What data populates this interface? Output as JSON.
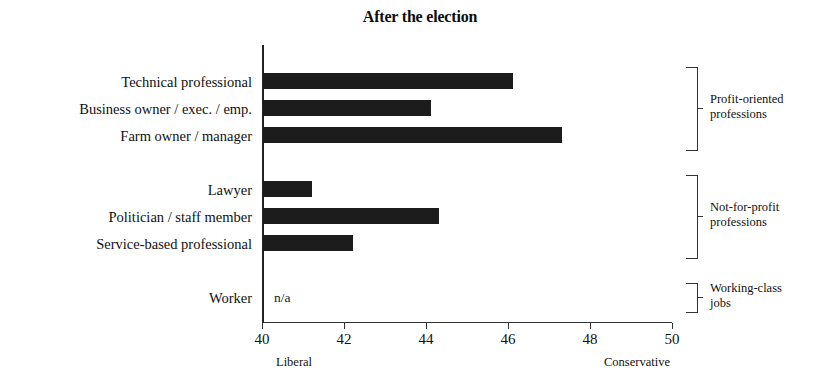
{
  "chart_data": {
    "type": "bar",
    "orientation": "horizontal",
    "title": "After the election",
    "xlabel": "",
    "ylabel": "",
    "xlim": [
      40,
      50
    ],
    "xticks": [
      40,
      42,
      44,
      46,
      48,
      50
    ],
    "xtick_labels": [
      "40",
      "42",
      "44",
      "46",
      "48",
      "50"
    ],
    "grid": false,
    "legend": false,
    "axis_pole_left": "Liberal",
    "axis_pole_right": "Conservative",
    "missing_value_label": "n/a",
    "bar_color": "#1c1c1c",
    "categories": [
      "Technical professional",
      "Business owner / exec. / emp.",
      "Farm owner / manager",
      "Lawyer",
      "Politician / staff member",
      "Service-based professional",
      "Worker"
    ],
    "values": [
      46.1,
      44.1,
      47.3,
      41.2,
      44.3,
      42.2,
      null
    ],
    "bars": [
      {
        "category": "Technical professional",
        "value": 46.1,
        "row": 0,
        "group": "Profit-oriented professions"
      },
      {
        "category": "Business owner / exec. / emp.",
        "value": 44.1,
        "row": 1,
        "group": "Profit-oriented professions"
      },
      {
        "category": "Farm owner / manager",
        "value": 47.3,
        "row": 2,
        "group": "Profit-oriented professions"
      },
      {
        "category": "Lawyer",
        "value": 41.2,
        "row": 4,
        "group": "Not-for-profit professions"
      },
      {
        "category": "Politician / staff member",
        "value": 44.3,
        "row": 5,
        "group": "Not-for-profit professions"
      },
      {
        "category": "Service-based professional",
        "value": 42.2,
        "row": 6,
        "group": "Not-for-profit professions"
      },
      {
        "category": "Worker",
        "value": null,
        "row": 8,
        "group": "Working-class jobs"
      }
    ],
    "groups": [
      {
        "label_line1": "Profit-oriented",
        "label_line2": "professions",
        "rows": [
          0,
          2
        ]
      },
      {
        "label_line1": "Not-for-profit",
        "label_line2": "professions",
        "rows": [
          4,
          6
        ]
      },
      {
        "label_line1": "Working-class",
        "label_line2": "jobs",
        "rows": [
          8,
          8
        ]
      }
    ]
  }
}
